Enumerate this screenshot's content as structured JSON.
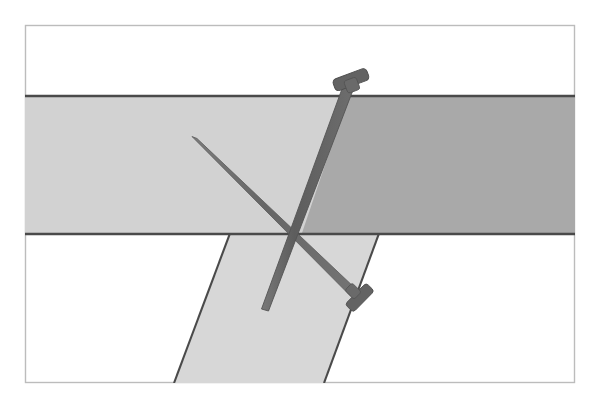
{
  "figure": {
    "canvas": {
      "width": 599,
      "height": 405,
      "background": "#ffffff"
    },
    "frame": {
      "name": "outer-frame",
      "x": 25,
      "y": 25,
      "width": 550,
      "height": 358,
      "fill": "#ffffff",
      "stroke": "#b9b9b9",
      "stroke_width": 1.4
    },
    "strips": [
      {
        "id": "horizontal-strip",
        "label": "Horizontal wooden strip",
        "orientation": "horizontal",
        "top_y": 96,
        "bottom_y": 234,
        "left_x": 25,
        "right_x": 575,
        "fill_light": "#d2d2d2",
        "fill_shadow": "#a9a9a9",
        "edge_stroke": "#4a4a4a",
        "edge_width": 2.2
      },
      {
        "id": "diagonal-strip",
        "label": "Diagonal wooden strip",
        "orientation": "diagonal",
        "fill": "#d7d7d7",
        "edge_stroke": "#4a4a4a",
        "edge_width": 2.0,
        "top_left_x": 232,
        "top_right_x": 381,
        "top_y": 234,
        "bottom_left_x": 174,
        "bottom_right_x": 324,
        "bottom_y": 383
      }
    ],
    "nails": [
      {
        "id": "long-nail",
        "label": "Long nail with head at top",
        "color": "#636363",
        "outline": "#4f4f4f",
        "head_position": "top",
        "head_center_x": 355,
        "head_center_y": 78,
        "head_length": 36,
        "head_thickness": 12,
        "shaft_start_x": 352,
        "shaft_start_y": 82,
        "shaft_end_x": 353,
        "shaft_end_y": 306,
        "shaft_width": 11,
        "tip_x": 353,
        "tip_y": 306
      },
      {
        "id": "short-nail",
        "label": "Thin nail angled down-right with head at bottom",
        "color": "#6b6b6b",
        "outline": "#565656",
        "head_position": "bottom-right",
        "head_center_x": 364,
        "head_center_y": 300,
        "head_length": 30,
        "head_thickness": 11,
        "tip_x": 193,
        "tip_y": 138,
        "shaft_width": 9
      }
    ],
    "palette": {
      "background": "#ffffff",
      "frame_stroke": "#b9b9b9",
      "strip_light": "#d2d2d2",
      "strip_shadow": "#a9a9a9",
      "strip_diagonal": "#d7d7d7",
      "strip_edge": "#4a4a4a",
      "nail_body": "#636363",
      "nail_dark": "#4f4f4f"
    }
  }
}
